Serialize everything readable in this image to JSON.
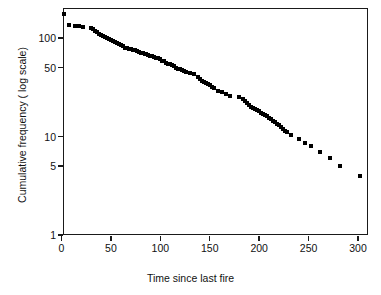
{
  "chart_data": {
    "type": "scatter",
    "title": "",
    "xlabel": "Time since last fire",
    "ylabel": "Cumulative frequency ( log scale)",
    "yscale": "log",
    "xscale": "linear",
    "xlim": [
      -8,
      310
    ],
    "ylim": [
      0.85,
      230
    ],
    "grid": false,
    "legend": null,
    "xticks": [
      0,
      50,
      100,
      150,
      200,
      250,
      300
    ],
    "xticklabels": [
      "0",
      "50",
      "100",
      "150",
      "200",
      "250",
      "300"
    ],
    "yticks": [
      1,
      5,
      10,
      50,
      100
    ],
    "yticklabels": [
      "1",
      "5",
      "10",
      "50",
      "100"
    ],
    "marker": "square",
    "marker_color": "#000000",
    "points": [
      {
        "x": 3,
        "y": 174
      },
      {
        "x": 8,
        "y": 137
      },
      {
        "x": 14,
        "y": 132
      },
      {
        "x": 18,
        "y": 131
      },
      {
        "x": 22,
        "y": 130
      },
      {
        "x": 30,
        "y": 127
      },
      {
        "x": 32,
        "y": 122
      },
      {
        "x": 34,
        "y": 118
      },
      {
        "x": 36,
        "y": 114
      },
      {
        "x": 38,
        "y": 111
      },
      {
        "x": 40,
        "y": 108
      },
      {
        "x": 42,
        "y": 105
      },
      {
        "x": 44,
        "y": 102
      },
      {
        "x": 46,
        "y": 99
      },
      {
        "x": 48,
        "y": 97
      },
      {
        "x": 50,
        "y": 95
      },
      {
        "x": 52,
        "y": 93
      },
      {
        "x": 54,
        "y": 91
      },
      {
        "x": 56,
        "y": 88
      },
      {
        "x": 58,
        "y": 86
      },
      {
        "x": 60,
        "y": 84
      },
      {
        "x": 62,
        "y": 82
      },
      {
        "x": 64,
        "y": 80
      },
      {
        "x": 66,
        "y": 79
      },
      {
        "x": 68,
        "y": 78
      },
      {
        "x": 70,
        "y": 77
      },
      {
        "x": 72,
        "y": 76
      },
      {
        "x": 74,
        "y": 75
      },
      {
        "x": 76,
        "y": 73
      },
      {
        "x": 78,
        "y": 72
      },
      {
        "x": 80,
        "y": 71
      },
      {
        "x": 82,
        "y": 70
      },
      {
        "x": 84,
        "y": 69
      },
      {
        "x": 86,
        "y": 68
      },
      {
        "x": 88,
        "y": 67
      },
      {
        "x": 90,
        "y": 66
      },
      {
        "x": 92,
        "y": 65
      },
      {
        "x": 94,
        "y": 64
      },
      {
        "x": 96,
        "y": 63
      },
      {
        "x": 98,
        "y": 62
      },
      {
        "x": 100,
        "y": 61
      },
      {
        "x": 102,
        "y": 59
      },
      {
        "x": 104,
        "y": 58
      },
      {
        "x": 106,
        "y": 56
      },
      {
        "x": 108,
        "y": 55
      },
      {
        "x": 110,
        "y": 54
      },
      {
        "x": 112,
        "y": 53
      },
      {
        "x": 114,
        "y": 52
      },
      {
        "x": 116,
        "y": 50
      },
      {
        "x": 118,
        "y": 49
      },
      {
        "x": 120,
        "y": 48
      },
      {
        "x": 122,
        "y": 47
      },
      {
        "x": 124,
        "y": 46
      },
      {
        "x": 126,
        "y": 45
      },
      {
        "x": 130,
        "y": 44
      },
      {
        "x": 134,
        "y": 43
      },
      {
        "x": 138,
        "y": 40
      },
      {
        "x": 140,
        "y": 38
      },
      {
        "x": 142,
        "y": 37
      },
      {
        "x": 144,
        "y": 36
      },
      {
        "x": 146,
        "y": 35
      },
      {
        "x": 148,
        "y": 34
      },
      {
        "x": 150,
        "y": 33
      },
      {
        "x": 152,
        "y": 32
      },
      {
        "x": 154,
        "y": 31
      },
      {
        "x": 158,
        "y": 29
      },
      {
        "x": 162,
        "y": 28
      },
      {
        "x": 166,
        "y": 27
      },
      {
        "x": 170,
        "y": 26
      },
      {
        "x": 180,
        "y": 25
      },
      {
        "x": 184,
        "y": 24
      },
      {
        "x": 186,
        "y": 23
      },
      {
        "x": 188,
        "y": 22
      },
      {
        "x": 190,
        "y": 21
      },
      {
        "x": 192,
        "y": 20
      },
      {
        "x": 194,
        "y": 19.5
      },
      {
        "x": 196,
        "y": 19
      },
      {
        "x": 198,
        "y": 18.5
      },
      {
        "x": 200,
        "y": 18
      },
      {
        "x": 202,
        "y": 17.5
      },
      {
        "x": 204,
        "y": 17
      },
      {
        "x": 206,
        "y": 16.5
      },
      {
        "x": 208,
        "y": 16
      },
      {
        "x": 210,
        "y": 15.5
      },
      {
        "x": 212,
        "y": 15
      },
      {
        "x": 214,
        "y": 14.5
      },
      {
        "x": 216,
        "y": 14
      },
      {
        "x": 218,
        "y": 13.5
      },
      {
        "x": 220,
        "y": 13
      },
      {
        "x": 222,
        "y": 12.5
      },
      {
        "x": 224,
        "y": 12
      },
      {
        "x": 226,
        "y": 11.5
      },
      {
        "x": 228,
        "y": 11
      },
      {
        "x": 232,
        "y": 10.4
      },
      {
        "x": 240,
        "y": 9.4
      },
      {
        "x": 246,
        "y": 8.6
      },
      {
        "x": 252,
        "y": 8
      },
      {
        "x": 262,
        "y": 7
      },
      {
        "x": 272,
        "y": 6
      },
      {
        "x": 282,
        "y": 5
      },
      {
        "x": 302,
        "y": 4
      },
      {
        "x": 340,
        "y": 3
      },
      {
        "x": 460,
        "y": 2
      },
      {
        "x": 700,
        "y": 1
      }
    ]
  },
  "axes": {
    "x": {
      "label": "Time since last fire",
      "ticks": [
        {
          "value": 0,
          "label": "0"
        },
        {
          "value": 50,
          "label": "50"
        },
        {
          "value": 100,
          "label": "100"
        },
        {
          "value": 150,
          "label": "150"
        },
        {
          "value": 200,
          "label": "200"
        },
        {
          "value": 250,
          "label": "250"
        },
        {
          "value": 300,
          "label": "300"
        }
      ]
    },
    "y": {
      "label": "Cumulative frequency ( log scale)",
      "ticks": [
        {
          "value": 1,
          "label": "1"
        },
        {
          "value": 5,
          "label": "5"
        },
        {
          "value": 10,
          "label": "10"
        },
        {
          "value": 50,
          "label": "50"
        },
        {
          "value": 100,
          "label": "100"
        }
      ]
    }
  },
  "style": {
    "frame_color": "#1a1a1a",
    "marker_color": "#000000",
    "text_color": "#111111",
    "background": "#ffffff"
  }
}
